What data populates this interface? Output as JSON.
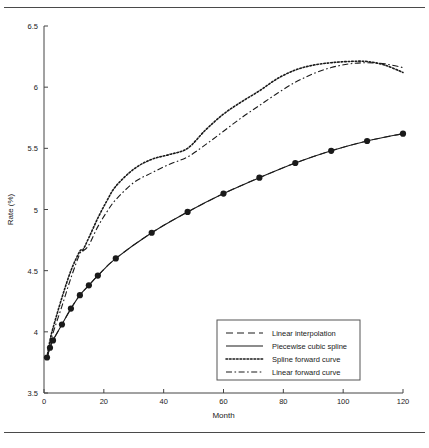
{
  "figure": {
    "title": "",
    "rules": {
      "top": "horizontal-rule",
      "bottom": "horizontal-rule"
    }
  },
  "chart_data": {
    "type": "line",
    "title": "",
    "xlabel": "Month",
    "ylabel": "Rate (%)",
    "xlim": [
      0,
      120
    ],
    "ylim": [
      3.5,
      6.5
    ],
    "xticks": [
      0,
      20,
      40,
      60,
      80,
      100,
      120
    ],
    "xtick_labels": [
      "0",
      "20",
      "40",
      "60",
      "80",
      "100",
      "120"
    ],
    "yticks": [
      3.5,
      4,
      4.5,
      5,
      5.5,
      6,
      6.5
    ],
    "ytick_labels": [
      "3.5",
      "4",
      "4.5",
      "5",
      "5.5",
      "6",
      "6.5"
    ],
    "grid": false,
    "legend_position": "lower right",
    "series": [
      {
        "name": "Linear interpolation",
        "style": "dashed",
        "color": "#333333",
        "marker": "none",
        "x": [
          1,
          2,
          3,
          6,
          9,
          12,
          15,
          18,
          24,
          36,
          48,
          60,
          72,
          84,
          96,
          108,
          120
        ],
        "y": [
          3.79,
          3.87,
          3.93,
          4.06,
          4.19,
          4.3,
          4.38,
          4.46,
          4.6,
          4.81,
          4.98,
          5.13,
          5.26,
          5.38,
          5.48,
          5.56,
          5.62
        ]
      },
      {
        "name": "Piecewise cubic spline",
        "style": "solid",
        "color": "#1a1a1a",
        "marker": "filled-circle",
        "x": [
          1,
          2,
          3,
          6,
          9,
          12,
          15,
          18,
          24,
          36,
          48,
          60,
          72,
          84,
          96,
          108,
          120
        ],
        "y": [
          3.79,
          3.87,
          3.93,
          4.06,
          4.19,
          4.3,
          4.38,
          4.46,
          4.6,
          4.81,
          4.98,
          5.13,
          5.26,
          5.38,
          5.48,
          5.56,
          5.62
        ]
      },
      {
        "name": "Spline forward curve",
        "style": "dotted",
        "color": "#1a1a1a",
        "marker": "none",
        "x": [
          1,
          2,
          3,
          6,
          9,
          12,
          13,
          15,
          18,
          21,
          24,
          30,
          36,
          42,
          48,
          54,
          60,
          66,
          72,
          78,
          84,
          90,
          96,
          102,
          108,
          114,
          120
        ],
        "y": [
          3.79,
          3.93,
          4.03,
          4.28,
          4.5,
          4.66,
          4.67,
          4.77,
          4.93,
          5.07,
          5.19,
          5.33,
          5.41,
          5.45,
          5.5,
          5.65,
          5.78,
          5.88,
          5.97,
          6.07,
          6.14,
          6.18,
          6.2,
          6.21,
          6.21,
          6.18,
          6.12
        ]
      },
      {
        "name": "Linear forward curve",
        "style": "dash-dot",
        "color": "#1a1a1a",
        "marker": "none",
        "x": [
          1,
          2,
          3,
          6,
          9,
          12,
          13,
          15,
          18,
          21,
          24,
          30,
          36,
          42,
          48,
          54,
          60,
          66,
          72,
          78,
          84,
          90,
          96,
          102,
          108,
          114,
          120
        ],
        "y": [
          3.79,
          3.9,
          3.99,
          4.21,
          4.44,
          4.64,
          4.66,
          4.71,
          4.86,
          4.98,
          5.08,
          5.22,
          5.3,
          5.37,
          5.43,
          5.53,
          5.64,
          5.75,
          5.85,
          5.95,
          6.04,
          6.11,
          6.16,
          6.19,
          6.2,
          6.19,
          6.16
        ]
      }
    ]
  },
  "legend": {
    "entries": [
      {
        "label": "Linear interpolation",
        "style": "dashed"
      },
      {
        "label": "Piecewise cubic spline",
        "style": "solid"
      },
      {
        "label": "Spline forward curve",
        "style": "dotted"
      },
      {
        "label": "Linear forward curve",
        "style": "dash-dot"
      }
    ]
  }
}
